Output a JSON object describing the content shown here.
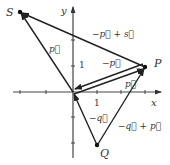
{
  "diagram": {
    "origin": [
      73,
      92
    ],
    "unit_px": 24,
    "axes": {
      "x_label": "x",
      "y_label": "y",
      "x_tick_label": "1",
      "y_tick_label": "1"
    },
    "points": {
      "P": {
        "label": "P",
        "coords": [
          3,
          1
        ]
      },
      "Q": {
        "label": "Q",
        "coords": [
          1,
          -2.2
        ]
      },
      "S": {
        "label": "S",
        "coords": [
          -2.2,
          3.3
        ]
      }
    },
    "vectors": [
      {
        "id": "p",
        "label": "p⃗",
        "from": "O",
        "to": "P"
      },
      {
        "id": "neg-p",
        "label": "−p⃗",
        "from": "P",
        "to": "O"
      },
      {
        "id": "s",
        "label": "s⃗",
        "from": "O",
        "to": "S"
      },
      {
        "id": "neg-p-plus-s",
        "label": "−p⃗ + s⃗",
        "from": "P",
        "to": "S"
      },
      {
        "id": "neg-q",
        "label": "−q⃗",
        "from": "Q",
        "to": "O"
      },
      {
        "id": "neg-q-plus-p",
        "label": "−q⃗ + p⃗",
        "from": "Q",
        "to": "P"
      }
    ],
    "colors": {
      "line": "#222222",
      "axis": "#333333"
    }
  }
}
